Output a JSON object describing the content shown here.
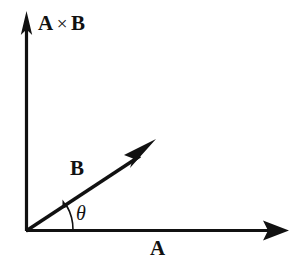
{
  "figure": {
    "background_color": "#ffffff",
    "stroke_color": "#111111",
    "width": 297,
    "height": 277
  },
  "labels": {
    "vertical_axis": {
      "vector_a": "A",
      "operator": "×",
      "vector_b": "B",
      "full": "A × B"
    },
    "diagonal_vector": "B",
    "horizontal_axis": "A",
    "angle": "θ"
  },
  "geometry": {
    "origin": {
      "x": 26,
      "y": 231
    },
    "vertical_axis": {
      "x1": 26,
      "y1": 231,
      "x2": 26,
      "y2": 12,
      "tip_label": "A × B"
    },
    "horizontal_axis": {
      "x1": 26,
      "y1": 231,
      "x2": 288,
      "y2": 231,
      "tip_label": "A"
    },
    "vector_b": {
      "x1": 26,
      "y1": 231,
      "x2": 152,
      "y2": 148,
      "angle_degrees": 33
    },
    "angle_arc": {
      "radius": 47,
      "start_degrees": 0,
      "end_degrees": 33
    }
  }
}
